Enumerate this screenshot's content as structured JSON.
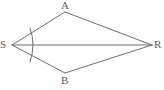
{
  "figure": {
    "kind": "geometry-diagram",
    "canvas": {
      "width": 164,
      "height": 90
    },
    "colors": {
      "background": "#ffffff",
      "stroke": "#6e6e6e",
      "label": "#5b5b5b"
    },
    "stroke_width": 1,
    "vertices": [
      {
        "id": "A",
        "label": "A",
        "x": 65,
        "y": 12,
        "label_x": 61,
        "label_y": 0
      },
      {
        "id": "R",
        "label": "R",
        "x": 152,
        "y": 45,
        "label_x": 154,
        "label_y": 39
      },
      {
        "id": "B",
        "label": "B",
        "x": 65,
        "y": 73,
        "label_x": 61,
        "label_y": 75
      },
      {
        "id": "S",
        "label": "S",
        "x": 12,
        "y": 45,
        "label_x": 0,
        "label_y": 39
      }
    ],
    "edges": [
      {
        "id": "SA",
        "from": "S",
        "to": "A"
      },
      {
        "id": "AR",
        "from": "A",
        "to": "R"
      },
      {
        "id": "RB",
        "from": "R",
        "to": "B"
      },
      {
        "id": "BS",
        "from": "B",
        "to": "S"
      }
    ],
    "diagonals": [
      {
        "id": "SR",
        "from": "S",
        "to": "R"
      }
    ],
    "angle_marks": [
      {
        "id": "angle-S",
        "at": "S",
        "radius": 23,
        "start_x": 30,
        "start_y": 28,
        "end_x": 30,
        "end_y": 62,
        "bulge_x": 35,
        "bulge_y": 45
      }
    ]
  }
}
